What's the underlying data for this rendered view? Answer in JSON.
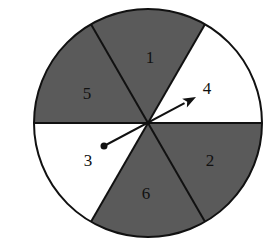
{
  "figure": {
    "type": "spinner",
    "center": [
      148,
      123
    ],
    "radius": 114,
    "colors": {
      "shaded": "#5a5a5a",
      "unshaded": "#ffffff",
      "stroke": "#111111",
      "label": "#111111"
    },
    "sectors": [
      {
        "label": "1",
        "shaded": true,
        "start_angle": -120,
        "end_angle": -60,
        "label_pos": [
          150,
          63
        ]
      },
      {
        "label": "4",
        "shaded": false,
        "start_angle": -60,
        "end_angle": 0,
        "label_pos": [
          207,
          94
        ]
      },
      {
        "label": "2",
        "shaded": true,
        "start_angle": 0,
        "end_angle": 60,
        "label_pos": [
          210,
          166
        ]
      },
      {
        "label": "6",
        "shaded": true,
        "start_angle": 60,
        "end_angle": 120,
        "label_pos": [
          146,
          199
        ]
      },
      {
        "label": "3",
        "shaded": false,
        "start_angle": 120,
        "end_angle": 180,
        "label_pos": [
          88,
          166
        ]
      },
      {
        "label": "5",
        "shaded": true,
        "start_angle": 180,
        "end_angle": 240,
        "label_pos": [
          87,
          99
        ]
      }
    ],
    "arrow": {
      "tail": [
        104,
        146
      ],
      "tip": [
        196,
        97
      ],
      "points_to": "4"
    }
  }
}
